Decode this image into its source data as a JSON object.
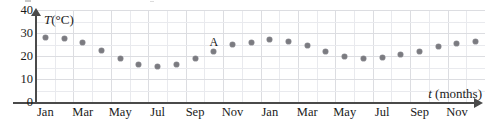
{
  "chart_data": {
    "type": "scatter",
    "title": "",
    "xlabel": "t (months)",
    "ylabel": "T (°C)",
    "y_axis_variable": "T",
    "y_axis_unit": "(°C)",
    "x_axis_variable": "t",
    "x_axis_unit": "(months)",
    "xlim": [
      0,
      24
    ],
    "ylim": [
      0,
      40
    ],
    "grid": true,
    "legend": "none",
    "ytick_labels": [
      "0",
      "10",
      "20",
      "30",
      "40"
    ],
    "ytick_values": [
      0,
      10,
      20,
      30,
      40
    ],
    "xtick_labels": [
      "Jan",
      "Mar",
      "May",
      "Jul",
      "Sep",
      "Nov",
      "Jan",
      "Mar",
      "May",
      "Jul",
      "Sep",
      "Nov"
    ],
    "categories": [
      "Jan",
      "Feb",
      "Mar",
      "Apr",
      "May",
      "Jun",
      "Jul",
      "Aug",
      "Sep",
      "Oct",
      "Nov",
      "Dec",
      "Jan",
      "Feb",
      "Mar",
      "Apr",
      "May",
      "Jun",
      "Jul",
      "Aug",
      "Sep",
      "Oct",
      "Nov",
      "Dec"
    ],
    "values": [
      28,
      27.5,
      26,
      22.5,
      19,
      16.5,
      15.5,
      16.5,
      19,
      22,
      25,
      26,
      27,
      26.5,
      24.5,
      22,
      20,
      19,
      19.5,
      20.5,
      22,
      24,
      25.5,
      26.5
    ],
    "point_color": "#7b7b80",
    "grid_color": "#dcdde1",
    "axis_color": "#4a4a4a",
    "annotations": [
      {
        "label": "A",
        "month_index": 9,
        "value": 22
      }
    ]
  },
  "plot": {
    "points": [
      {
        "month": "Jan",
        "x": 0.5,
        "y": 28
      },
      {
        "month": "Feb",
        "x": 1.5,
        "y": 27.5
      },
      {
        "month": "Mar",
        "x": 2.5,
        "y": 26
      },
      {
        "month": "Apr",
        "x": 3.5,
        "y": 22.5
      },
      {
        "month": "May",
        "x": 4.5,
        "y": 19
      },
      {
        "month": "Jun",
        "x": 5.5,
        "y": 16.5
      },
      {
        "month": "Jul",
        "x": 6.5,
        "y": 15.5
      },
      {
        "month": "Aug",
        "x": 7.5,
        "y": 16.5
      },
      {
        "month": "Sep",
        "x": 8.5,
        "y": 19
      },
      {
        "month": "Oct",
        "x": 9.5,
        "y": 22
      },
      {
        "month": "Nov",
        "x": 10.5,
        "y": 25
      },
      {
        "month": "Dec",
        "x": 11.5,
        "y": 26
      },
      {
        "month": "Jan",
        "x": 12.5,
        "y": 27
      },
      {
        "month": "Feb",
        "x": 13.5,
        "y": 26.5
      },
      {
        "month": "Mar",
        "x": 14.5,
        "y": 24.5
      },
      {
        "month": "Apr",
        "x": 15.5,
        "y": 22
      },
      {
        "month": "May",
        "x": 16.5,
        "y": 20
      },
      {
        "month": "Jun",
        "x": 17.5,
        "y": 19
      },
      {
        "month": "Jul",
        "x": 18.5,
        "y": 19.5
      },
      {
        "month": "Aug",
        "x": 19.5,
        "y": 20.5
      },
      {
        "month": "Sep",
        "x": 20.5,
        "y": 22
      },
      {
        "month": "Oct",
        "x": 21.5,
        "y": 24
      },
      {
        "month": "Nov",
        "x": 22.5,
        "y": 25.5
      },
      {
        "month": "Dec",
        "x": 23.5,
        "y": 26.5
      }
    ],
    "xticks": [
      {
        "label": "Jan",
        "x": 0.5
      },
      {
        "label": "Mar",
        "x": 2.5
      },
      {
        "label": "May",
        "x": 4.5
      },
      {
        "label": "Jul",
        "x": 6.5
      },
      {
        "label": "Sep",
        "x": 8.5
      },
      {
        "label": "Nov",
        "x": 10.5
      },
      {
        "label": "Jan",
        "x": 12.5
      },
      {
        "label": "Mar",
        "x": 14.5
      },
      {
        "label": "May",
        "x": 16.5
      },
      {
        "label": "Jul",
        "x": 18.5
      },
      {
        "label": "Sep",
        "x": 20.5
      },
      {
        "label": "Nov",
        "x": 22.5
      }
    ],
    "yticks": [
      {
        "label": "40",
        "v": 40
      },
      {
        "label": "30",
        "v": 30
      },
      {
        "label": "20",
        "v": 20
      },
      {
        "label": "10",
        "v": 10
      },
      {
        "label": "0",
        "v": 0
      }
    ]
  }
}
